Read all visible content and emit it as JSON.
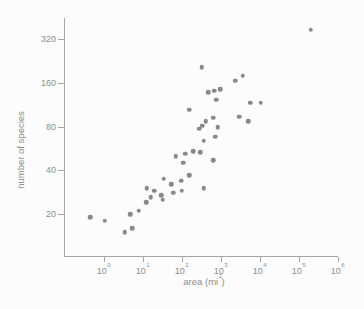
{
  "chart_data": {
    "type": "scatter",
    "title": "",
    "xlabel_prefix": "area (mi",
    "xlabel_sup": "2",
    "xlabel_suffix": ")",
    "ylabel": "number of species",
    "x_scale": "log10",
    "y_scale": "log2",
    "x_tick_base": "10",
    "x_tick_exponents": [
      0,
      1,
      2,
      3,
      4,
      5,
      6
    ],
    "y_ticks": [
      20,
      40,
      80,
      160,
      320
    ],
    "xlim": [
      0.1,
      1000000
    ],
    "ylim": [
      12,
      450
    ],
    "grid": false,
    "legend": null,
    "points": [
      [
        0.46,
        19
      ],
      [
        1.07,
        18
      ],
      [
        3.5,
        15
      ],
      [
        5.4,
        16
      ],
      [
        4.8,
        20
      ],
      [
        8,
        21
      ],
      [
        12.3,
        24
      ],
      [
        16.5,
        26
      ],
      [
        13,
        30
      ],
      [
        20,
        29
      ],
      [
        30,
        27
      ],
      [
        33,
        25
      ],
      [
        35,
        35
      ],
      [
        55,
        32
      ],
      [
        62,
        28
      ],
      [
        98,
        34
      ],
      [
        102,
        29
      ],
      [
        160,
        37
      ],
      [
        370,
        30
      ],
      [
        72,
        50
      ],
      [
        125,
        52
      ],
      [
        200,
        54
      ],
      [
        300,
        53
      ],
      [
        660,
        47
      ],
      [
        112,
        45
      ],
      [
        157,
        104
      ],
      [
        330,
        205
      ],
      [
        2400,
        165
      ],
      [
        3700,
        179
      ],
      [
        490,
        138
      ],
      [
        690,
        141
      ],
      [
        980,
        144
      ],
      [
        780,
        122
      ],
      [
        3000,
        93
      ],
      [
        5100,
        87
      ],
      [
        660,
        92
      ],
      [
        420,
        87
      ],
      [
        345,
        81
      ],
      [
        284,
        77
      ],
      [
        860,
        79
      ],
      [
        730,
        68
      ],
      [
        370,
        64
      ],
      [
        5800,
        117
      ],
      [
        10900,
        117
      ],
      [
        208000,
        371
      ]
    ]
  },
  "colors": {
    "dot": "#898989",
    "axis": "#a6a6a6",
    "text": "#8d8d8d",
    "background": "#fcfcfc"
  }
}
